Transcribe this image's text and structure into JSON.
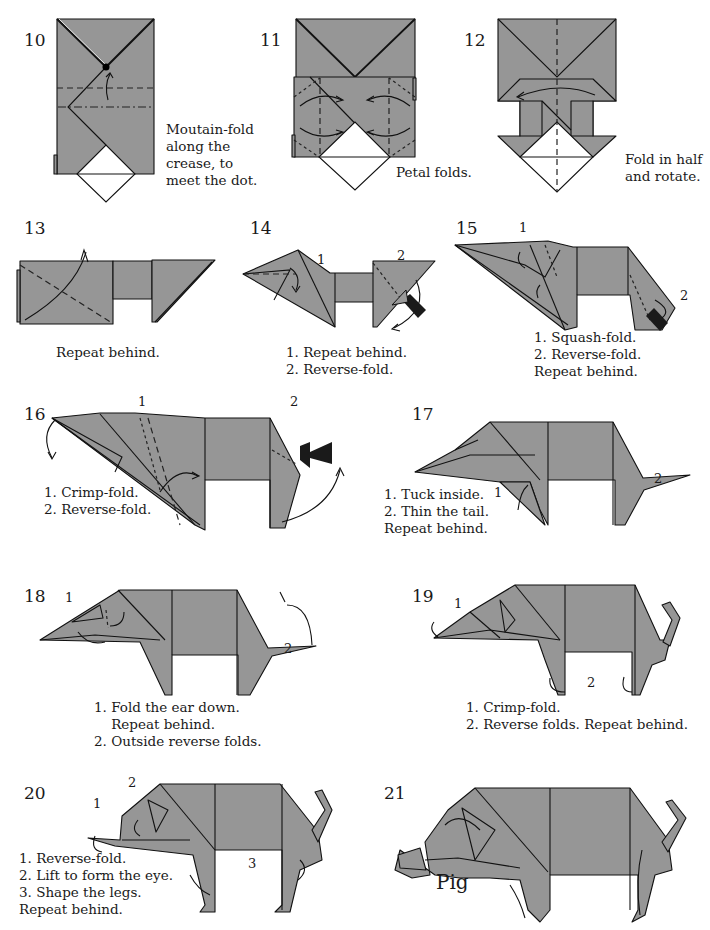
{
  "diagram": {
    "colors": {
      "paper": "#969696",
      "paper_back": "#ffffff",
      "line": "#111111",
      "push_arrow": "#1a1a1a"
    },
    "steps": [
      {
        "number": "10",
        "caption": "Moutain-fold\nalong the\ncrease, to\nmeet the dot.",
        "labels": []
      },
      {
        "number": "11",
        "caption": "Petal folds.",
        "labels": []
      },
      {
        "number": "12",
        "caption": "Fold in half\nand rotate.",
        "labels": []
      },
      {
        "number": "13",
        "caption": "Repeat behind.",
        "labels": []
      },
      {
        "number": "14",
        "caption": "1. Repeat behind.\n2. Reverse-fold.",
        "labels": [
          "1",
          "2"
        ]
      },
      {
        "number": "15",
        "caption": "1. Squash-fold.\n2. Reverse-fold.\nRepeat behind.",
        "labels": [
          "1",
          "2"
        ]
      },
      {
        "number": "16",
        "caption": "1. Crimp-fold.\n2. Reverse-fold.",
        "labels": [
          "1",
          "2"
        ]
      },
      {
        "number": "17",
        "caption": "1. Tuck inside.\n2. Thin the tail.\nRepeat behind.",
        "labels": [
          "1",
          "2"
        ]
      },
      {
        "number": "18",
        "caption": "1. Fold the ear down.\n    Repeat behind.\n2. Outside reverse folds.",
        "labels": [
          "1",
          "2"
        ]
      },
      {
        "number": "19",
        "caption": "1. Crimp-fold.\n2. Reverse folds. Repeat behind.",
        "labels": [
          "1",
          "2"
        ]
      },
      {
        "number": "20",
        "caption": "1. Reverse-fold.\n2. Lift to form the eye.\n3. Shape the legs.\nRepeat behind.",
        "labels": [
          "1",
          "2",
          "3"
        ]
      },
      {
        "number": "21",
        "caption": "",
        "labels": []
      }
    ],
    "final_title": "Pig"
  }
}
